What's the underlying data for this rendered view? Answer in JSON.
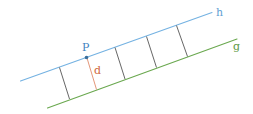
{
  "diagram": {
    "labels": {
      "line_h": "h",
      "line_g": "g",
      "point_p": "P",
      "distance": "d"
    },
    "colors": {
      "line_h": "#74b2e2",
      "line_g": "#6aa84f",
      "point_p": "#3a6f9c",
      "label_p": "#3f82c0",
      "distance": "#e08a6a",
      "label_d": "#d0693e",
      "segments": "#555555",
      "label_g": "#5e9a45",
      "label_h": "#5f9fd3"
    },
    "line_h": {
      "x1": 20.5,
      "y1": 81,
      "x2": 212,
      "y2": 12.5
    },
    "line_g": {
      "x1": 47.5,
      "y1": 108,
      "x2": 237,
      "y2": 39
    },
    "point_p": {
      "x": 86.5,
      "y": 57.5
    },
    "segments": [
      {
        "x1": 59.5,
        "y1": 67.5,
        "x2": 69.5,
        "y2": 99,
        "highlight": false
      },
      {
        "x1": 87,
        "y1": 58,
        "x2": 96.5,
        "y2": 89.5,
        "highlight": true
      },
      {
        "x1": 115,
        "y1": 47.5,
        "x2": 125,
        "y2": 79,
        "highlight": false
      },
      {
        "x1": 146.5,
        "y1": 36.5,
        "x2": 156.5,
        "y2": 67.5,
        "highlight": false
      },
      {
        "x1": 176.5,
        "y1": 25.5,
        "x2": 187.5,
        "y2": 56.5,
        "highlight": false
      }
    ]
  }
}
